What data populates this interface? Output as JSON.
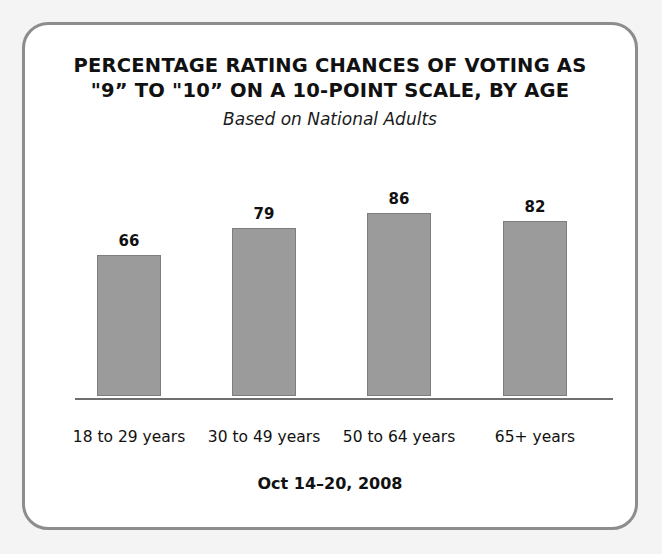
{
  "frame": {
    "border_color": "#8d8d8d",
    "background": "#ffffff",
    "outer_background": "#f4f4f4"
  },
  "chart_data": {
    "type": "bar",
    "title": "PERCENTAGE RATING CHANCES OF VOTING AS\n\"9” TO \"10” ON A 10-POINT SCALE, BY AGE",
    "title_lines": [
      "PERCENTAGE RATING CHANCES OF VOTING AS",
      "\"9” TO \"10” ON A 10-POINT SCALE, BY AGE"
    ],
    "subtitle": "Based on National Adults",
    "footer": "Oct 14–20, 2008",
    "categories": [
      "18 to 29 years",
      "30 to 49 years",
      "50 to 64 years",
      "65+ years"
    ],
    "values": [
      66,
      79,
      86,
      82
    ],
    "xlabel": "",
    "ylabel": "",
    "ylim": [
      0,
      100
    ],
    "grid": false,
    "legend": false,
    "bar_color": "#9b9b9b",
    "bar_border_color": "#7d7d7d",
    "axis_color": "#6f6f6f",
    "value_labels": [
      "66",
      "79",
      "86",
      "82"
    ]
  }
}
